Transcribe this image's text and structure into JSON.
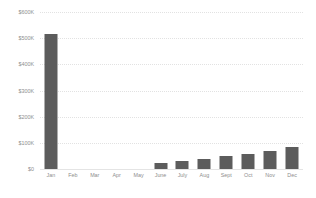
{
  "chart_data": {
    "type": "bar",
    "title": "",
    "subtitle": "",
    "xlabel": "",
    "ylabel": "",
    "categories": [
      "Jan",
      "Feb",
      "Mar",
      "Apr",
      "May",
      "June",
      "July",
      "Aug",
      "Sept",
      "Oct",
      "Nov",
      "Dec"
    ],
    "values": [
      515000,
      0,
      0,
      0,
      0,
      22000,
      30000,
      38000,
      48000,
      58000,
      68000,
      85000
    ],
    "ylim": [
      0,
      600000
    ],
    "yticks": [
      0,
      100000,
      200000,
      300000,
      400000,
      500000,
      600000
    ],
    "ytick_labels": [
      "$0",
      "$100K",
      "$200K",
      "$300K",
      "$400K",
      "$500K",
      "$600K"
    ],
    "grid": true,
    "legend": false,
    "legend_position": "none",
    "series": [
      {
        "name": "Revenue",
        "values": [
          515000,
          0,
          0,
          0,
          0,
          22000,
          30000,
          38000,
          48000,
          58000,
          68000,
          85000
        ]
      }
    ]
  },
  "style": {
    "bar_color": "#5c5c5c",
    "gridline_color": "#e2e2e2",
    "axis_text_color": "#8e8e8e",
    "background_color": "#ffffff"
  }
}
